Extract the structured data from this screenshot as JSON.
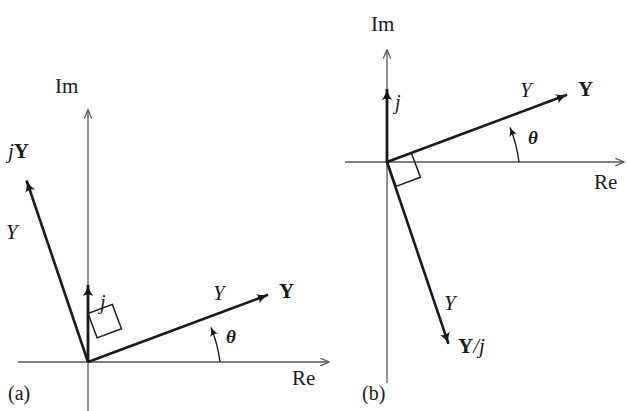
{
  "figure": {
    "background_color": "#ffffff",
    "ink_color": "#1a1a1a",
    "axis_color": "#555555",
    "width": 628,
    "height": 411
  },
  "panels": [
    {
      "id": "a",
      "caption": "(a)",
      "origin": [
        88,
        362
      ],
      "axes": {
        "imaginary": {
          "label": "Im",
          "label_pos": [
            55,
            76
          ],
          "from": [
            88,
            411
          ],
          "to": [
            88,
            108
          ]
        },
        "real": {
          "label": "Re",
          "label_pos": [
            292,
            368
          ],
          "from": [
            18,
            362
          ],
          "to": [
            331,
            362
          ]
        }
      },
      "vectors": [
        {
          "name": "Y",
          "label": "Y",
          "style": "bold-roman",
          "label_pos": [
            279,
            281
          ],
          "magnitude_label": "Y",
          "magnitude_label_pos": [
            213,
            283
          ],
          "from": [
            88,
            362
          ],
          "to": [
            273,
            293
          ]
        },
        {
          "name": "jY",
          "label": "jY",
          "style": "italic-j-bold-Y",
          "label_pos": [
            8,
            141
          ],
          "magnitude_label": "Y",
          "magnitude_label_pos": [
            6,
            222
          ],
          "from": [
            88,
            362
          ],
          "to": [
            23,
            170
          ]
        },
        {
          "name": "j",
          "label": "j",
          "style": "italic",
          "label_pos": [
            100,
            292
          ],
          "from": [
            88,
            362
          ],
          "to": [
            88,
            274
          ]
        }
      ],
      "angle": {
        "label": "θ",
        "label_pos": [
          226,
          327
        ],
        "vertex": [
          88,
          362
        ],
        "from_deg": 0,
        "to_deg": 20.5,
        "radius": 132
      },
      "right_angle": {
        "at": [
          88,
          362
        ],
        "leg1_deg": 20.5,
        "leg2_deg": 110.5,
        "size": 26
      }
    },
    {
      "id": "b",
      "caption": "(b)",
      "origin": [
        387,
        162
      ],
      "axes": {
        "imaginary": {
          "label": "Im",
          "label_pos": [
            371,
            14
          ],
          "from": [
            387,
            383
          ],
          "to": [
            387,
            48
          ]
        },
        "real": {
          "label": "Re",
          "label_pos": [
            594,
            172
          ],
          "from": [
            345,
            162
          ],
          "to": [
            626,
            162
          ]
        }
      },
      "vectors": [
        {
          "name": "Y",
          "label": "Y",
          "style": "bold-roman",
          "label_pos": [
            578,
            79
          ],
          "magnitude_label": "Y",
          "magnitude_label_pos": [
            520,
            80
          ],
          "from": [
            387,
            162
          ],
          "to": [
            572,
            93
          ]
        },
        {
          "name": "Y/j",
          "label": "Y/j",
          "style": "bold-Y-italic-j",
          "label_pos": [
            458,
            336
          ],
          "magnitude_label": "Y",
          "magnitude_label_pos": [
            444,
            293
          ],
          "from": [
            387,
            162
          ],
          "to": [
            452,
            354
          ]
        },
        {
          "name": "j",
          "label": "j",
          "style": "italic",
          "label_pos": [
            395,
            92
          ],
          "from": [
            387,
            162
          ],
          "to": [
            387,
            78
          ]
        }
      ],
      "angle": {
        "label": "θ",
        "label_pos": [
          528,
          128
        ],
        "vertex": [
          387,
          162
        ],
        "from_deg": 0,
        "to_deg": 20.5,
        "radius": 132
      },
      "right_angle": {
        "at": [
          387,
          162
        ],
        "leg1_deg": 20.5,
        "leg2_deg": -69.5,
        "size": 26
      }
    }
  ],
  "labels": {
    "im": "Im",
    "re": "Re",
    "theta": "θ",
    "y_italic": "Y",
    "y_bold": "Y",
    "j_italic": "j",
    "jY": "jY",
    "Y_over_j": "Y/j",
    "panel_a": "(a)",
    "panel_b": "(b)"
  }
}
